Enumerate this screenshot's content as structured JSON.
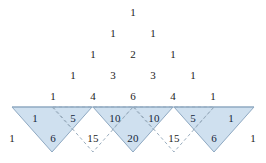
{
  "figure": {
    "colors": {
      "tile_fill": "#cfe0ef",
      "tile_stroke": "#8fa9c2",
      "dashed_stroke": "#93a6b8",
      "baseline_stroke": "#8fa9c2",
      "number_color": "#1c1c1c"
    },
    "layout": {
      "width": 266,
      "height": 163,
      "row_step_y": 21,
      "col_step_x": 20.5,
      "apex_x": 133,
      "apex_y": 12,
      "baseline_y": 107,
      "tile_half_width": 40,
      "tile_height": 45
    }
  },
  "pascal": {
    "rows": [
      {
        "index": 0,
        "values": [
          "1"
        ],
        "y": 12,
        "shaded": false
      },
      {
        "index": 1,
        "values": [
          "1",
          "1"
        ],
        "y": 33,
        "shaded": false
      },
      {
        "index": 2,
        "values": [
          "1",
          "2",
          "1"
        ],
        "y": 54,
        "shaded": false
      },
      {
        "index": 3,
        "values": [
          "1",
          "3",
          "3",
          "1"
        ],
        "y": 75,
        "shaded": false
      },
      {
        "index": 4,
        "values": [
          "1",
          "4",
          "6",
          "4",
          "1"
        ],
        "y": 96,
        "shaded": false
      },
      {
        "index": 5,
        "values": [
          "1",
          "5",
          "10",
          "10",
          "5",
          "1"
        ],
        "y": 118,
        "shaded": true
      },
      {
        "index": 6,
        "values": [
          "1",
          "6",
          "15",
          "20",
          "15",
          "6",
          "1"
        ],
        "y": 138,
        "shaded": true
      }
    ]
  },
  "tiles": {
    "solid": [
      {
        "name": "tile-left-outer",
        "cx": 52,
        "labels": [
          "1",
          "5",
          "6"
        ]
      },
      {
        "name": "tile-center",
        "cx": 133,
        "labels": [
          "10",
          "10",
          "20"
        ]
      },
      {
        "name": "tile-right-outer",
        "cx": 214,
        "labels": [
          "5",
          "1",
          "6"
        ]
      }
    ],
    "dashed": [
      {
        "name": "tile-dashed-left",
        "cx": 93,
        "labels": [
          "15"
        ]
      },
      {
        "name": "tile-dashed-right",
        "cx": 174,
        "labels": [
          "15"
        ]
      }
    ]
  }
}
